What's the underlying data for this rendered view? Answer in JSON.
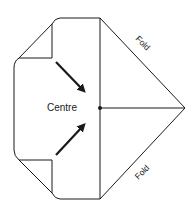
{
  "diagram": {
    "labels": {
      "centre": "Centre",
      "fold_top": "Fold",
      "fold_bottom": "Fold"
    },
    "colors": {
      "stroke": "#1a1a1a",
      "background": "#ffffff"
    },
    "elements": {
      "center_point": "centre-dot",
      "arrows": [
        {
          "direction": "down-right",
          "meaning": "fold top flap toward centre"
        },
        {
          "direction": "up-right",
          "meaning": "fold bottom flap toward centre"
        }
      ]
    }
  }
}
